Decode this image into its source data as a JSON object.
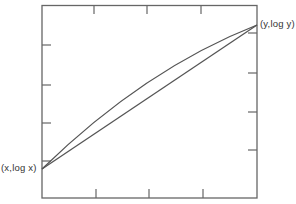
{
  "diagram": {
    "left_label": "(x,log x)",
    "right_label": "(y,log y)",
    "curves": [
      {
        "name": "log-curve",
        "type": "concave curve",
        "from": "(x,log x)",
        "to": "(y,log y)"
      },
      {
        "name": "chord",
        "type": "straight line",
        "from": "(x,log x)",
        "to": "(y,log y)"
      }
    ],
    "frame_ticks": {
      "top": 3,
      "bottom": 3,
      "left": 4,
      "right": 4
    },
    "stroke_color": "#555555"
  }
}
